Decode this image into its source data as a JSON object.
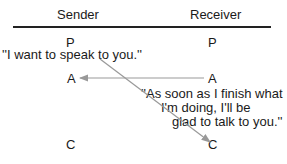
{
  "columns": {
    "sender": "Sender",
    "receiver": "Receiver"
  },
  "states": {
    "sender": [
      "P",
      "A",
      "C"
    ],
    "receiver": [
      "P",
      "A",
      "C"
    ]
  },
  "messages": [
    {
      "text": "''I want to speak to you.''",
      "from": "sender.P",
      "to": "receiver.C"
    },
    {
      "line1": "''As soon as I finish what",
      "line2": "I'm doing, I'll be",
      "line3": "glad to talk to you.''",
      "from": "receiver.A",
      "to": "sender.A"
    }
  ],
  "colors": {
    "arrow": "#999999",
    "text": "#1a1a1a"
  }
}
